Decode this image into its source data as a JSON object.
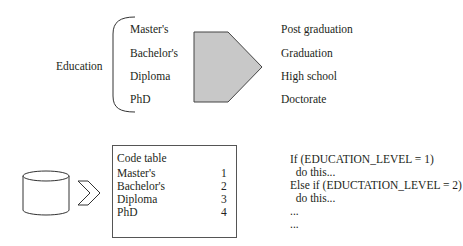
{
  "top_mapping": {
    "category_label": "Education",
    "source_values": [
      "Master's",
      "Bachelor's",
      "Diploma",
      "PhD"
    ],
    "target_values": [
      "Post graduation",
      "Graduation",
      "High school",
      "Doctorate"
    ],
    "arrow_fill": "#c8c8c8"
  },
  "code_table": {
    "title": "Code table",
    "rows": [
      {
        "label": "Master's",
        "code": "1"
      },
      {
        "label": "Bachelor's",
        "code": "2"
      },
      {
        "label": "Diploma",
        "code": "3"
      },
      {
        "label": "PhD",
        "code": "4"
      }
    ]
  },
  "pseudo_code": {
    "lines": [
      "If (EDUCATION_LEVEL = 1)",
      "  do this...",
      "Else if (EDUCTATION_LEVEL = 2)",
      "  do this...",
      "...",
      "..."
    ]
  }
}
